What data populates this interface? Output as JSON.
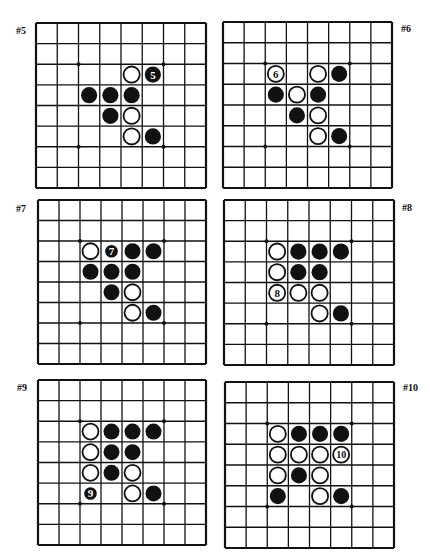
{
  "board_size": 8,
  "colors": {
    "line": "#111111",
    "black_stone": "#111111",
    "white_stone": "#ffffff",
    "background": "#ffffff"
  },
  "star_points": [
    [
      2,
      2
    ],
    [
      2,
      6
    ],
    [
      6,
      2
    ],
    [
      6,
      6
    ]
  ],
  "boards": [
    {
      "label": "#5",
      "label_pos": {
        "x": 16,
        "y": 25
      },
      "rect": {
        "x": 36,
        "y": 23,
        "w": 170,
        "h": 165
      },
      "stones": [
        {
          "r": 2,
          "c": 4,
          "color": "white"
        },
        {
          "r": 2,
          "c": 5,
          "color": "black",
          "num": "5"
        },
        {
          "r": 3,
          "c": 2,
          "color": "black"
        },
        {
          "r": 3,
          "c": 3,
          "color": "black"
        },
        {
          "r": 3,
          "c": 4,
          "color": "black"
        },
        {
          "r": 4,
          "c": 3,
          "color": "black"
        },
        {
          "r": 4,
          "c": 4,
          "color": "white"
        },
        {
          "r": 5,
          "c": 4,
          "color": "white"
        },
        {
          "r": 5,
          "c": 5,
          "color": "black"
        }
      ]
    },
    {
      "label": "#6",
      "label_pos": {
        "x": 401,
        "y": 23
      },
      "rect": {
        "x": 223,
        "y": 22,
        "w": 169,
        "h": 166
      },
      "stones": [
        {
          "r": 2,
          "c": 2,
          "color": "white",
          "num": "6"
        },
        {
          "r": 2,
          "c": 4,
          "color": "white"
        },
        {
          "r": 2,
          "c": 5,
          "color": "black"
        },
        {
          "r": 3,
          "c": 2,
          "color": "black"
        },
        {
          "r": 3,
          "c": 3,
          "color": "white"
        },
        {
          "r": 3,
          "c": 4,
          "color": "black"
        },
        {
          "r": 4,
          "c": 3,
          "color": "black"
        },
        {
          "r": 4,
          "c": 4,
          "color": "white"
        },
        {
          "r": 5,
          "c": 4,
          "color": "white"
        },
        {
          "r": 5,
          "c": 5,
          "color": "black"
        }
      ]
    },
    {
      "label": "#7",
      "label_pos": {
        "x": 16,
        "y": 203
      },
      "rect": {
        "x": 38,
        "y": 200,
        "w": 168,
        "h": 164
      },
      "stones": [
        {
          "r": 2,
          "c": 2,
          "color": "white"
        },
        {
          "r": 2,
          "c": 3,
          "color": "black",
          "num": "7",
          "small": true
        },
        {
          "r": 2,
          "c": 4,
          "color": "black"
        },
        {
          "r": 2,
          "c": 5,
          "color": "black"
        },
        {
          "r": 3,
          "c": 2,
          "color": "black"
        },
        {
          "r": 3,
          "c": 3,
          "color": "black"
        },
        {
          "r": 3,
          "c": 4,
          "color": "black"
        },
        {
          "r": 4,
          "c": 3,
          "color": "black"
        },
        {
          "r": 4,
          "c": 4,
          "color": "white"
        },
        {
          "r": 5,
          "c": 4,
          "color": "white"
        },
        {
          "r": 5,
          "c": 5,
          "color": "black"
        }
      ]
    },
    {
      "label": "#8",
      "label_pos": {
        "x": 402,
        "y": 202
      },
      "rect": {
        "x": 224,
        "y": 200,
        "w": 170,
        "h": 165
      },
      "stones": [
        {
          "r": 2,
          "c": 2,
          "color": "white"
        },
        {
          "r": 2,
          "c": 3,
          "color": "black"
        },
        {
          "r": 2,
          "c": 4,
          "color": "black"
        },
        {
          "r": 2,
          "c": 5,
          "color": "black"
        },
        {
          "r": 3,
          "c": 2,
          "color": "white"
        },
        {
          "r": 3,
          "c": 3,
          "color": "black"
        },
        {
          "r": 3,
          "c": 4,
          "color": "black"
        },
        {
          "r": 4,
          "c": 2,
          "color": "white",
          "num": "8"
        },
        {
          "r": 4,
          "c": 3,
          "color": "white"
        },
        {
          "r": 4,
          "c": 4,
          "color": "white"
        },
        {
          "r": 5,
          "c": 4,
          "color": "white"
        },
        {
          "r": 5,
          "c": 5,
          "color": "black"
        }
      ]
    },
    {
      "label": "#9",
      "label_pos": {
        "x": 17,
        "y": 382
      },
      "rect": {
        "x": 38,
        "y": 380,
        "w": 168,
        "h": 165
      },
      "stones": [
        {
          "r": 2,
          "c": 2,
          "color": "white"
        },
        {
          "r": 2,
          "c": 3,
          "color": "black"
        },
        {
          "r": 2,
          "c": 4,
          "color": "black"
        },
        {
          "r": 2,
          "c": 5,
          "color": "black"
        },
        {
          "r": 3,
          "c": 2,
          "color": "white"
        },
        {
          "r": 3,
          "c": 3,
          "color": "black"
        },
        {
          "r": 3,
          "c": 4,
          "color": "black"
        },
        {
          "r": 4,
          "c": 2,
          "color": "white"
        },
        {
          "r": 4,
          "c": 3,
          "color": "black"
        },
        {
          "r": 4,
          "c": 4,
          "color": "white"
        },
        {
          "r": 5,
          "c": 2,
          "color": "black",
          "num": "9",
          "small": true
        },
        {
          "r": 5,
          "c": 4,
          "color": "white"
        },
        {
          "r": 5,
          "c": 5,
          "color": "black"
        }
      ]
    },
    {
      "label": "#10",
      "label_pos": {
        "x": 403,
        "y": 382
      },
      "rect": {
        "x": 225,
        "y": 382,
        "w": 169,
        "h": 166
      },
      "stones": [
        {
          "r": 2,
          "c": 2,
          "color": "white"
        },
        {
          "r": 2,
          "c": 3,
          "color": "black"
        },
        {
          "r": 2,
          "c": 4,
          "color": "black"
        },
        {
          "r": 2,
          "c": 5,
          "color": "black"
        },
        {
          "r": 3,
          "c": 2,
          "color": "white"
        },
        {
          "r": 3,
          "c": 3,
          "color": "white"
        },
        {
          "r": 3,
          "c": 4,
          "color": "white"
        },
        {
          "r": 3,
          "c": 5,
          "color": "white",
          "num": "10"
        },
        {
          "r": 4,
          "c": 2,
          "color": "white"
        },
        {
          "r": 4,
          "c": 3,
          "color": "black"
        },
        {
          "r": 4,
          "c": 4,
          "color": "white"
        },
        {
          "r": 5,
          "c": 2,
          "color": "black"
        },
        {
          "r": 5,
          "c": 4,
          "color": "white"
        },
        {
          "r": 5,
          "c": 5,
          "color": "black"
        }
      ]
    }
  ]
}
